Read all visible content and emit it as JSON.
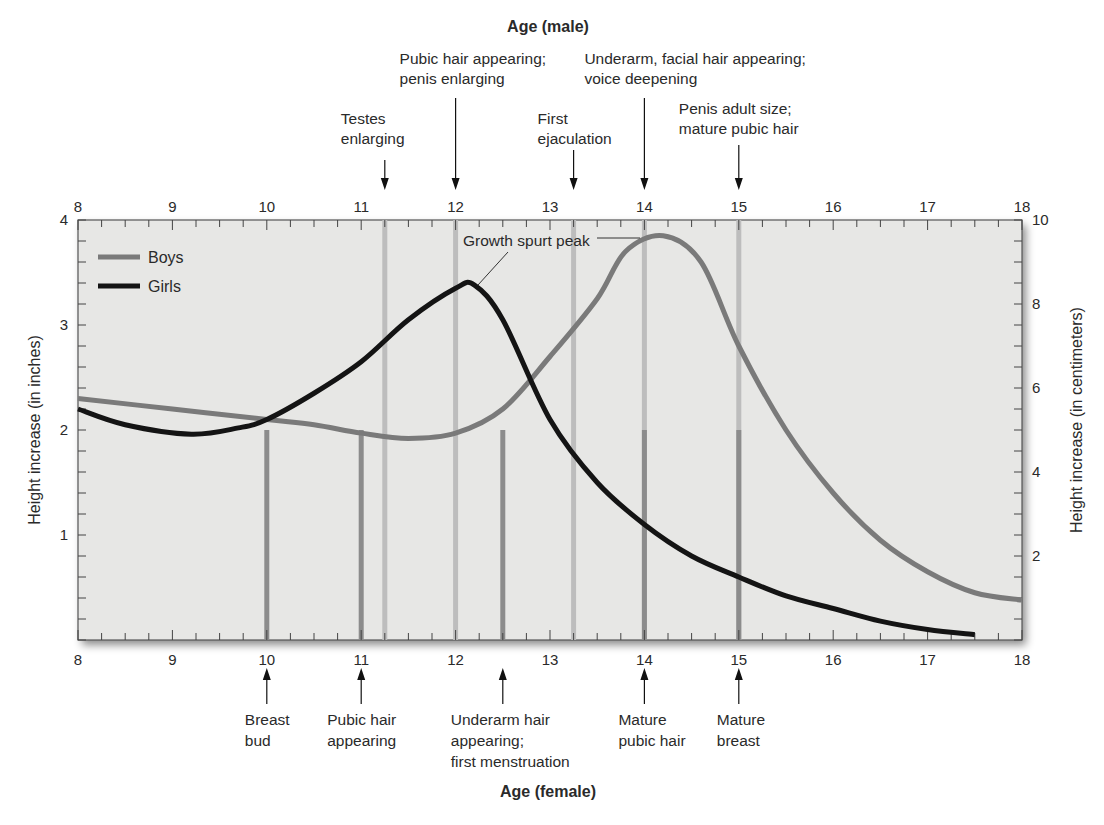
{
  "chart_data": {
    "type": "line",
    "title": "",
    "top_axis_title": "Age (male)",
    "bottom_axis_title": "Age (female)",
    "ylabel_left": "Height increase (in inches)",
    "ylabel_right": "Height increase (in centimeters)",
    "x_ticks": [
      "8",
      "9",
      "10",
      "11",
      "12",
      "13",
      "14",
      "15",
      "16",
      "17",
      "18"
    ],
    "y_ticks_left": [
      "1",
      "2",
      "3",
      "4"
    ],
    "y_ticks_right": [
      "2",
      "4",
      "6",
      "8",
      "10"
    ],
    "ylim_inches": [
      0,
      4
    ],
    "ylim_cm": [
      0,
      10
    ],
    "xlim": [
      8,
      18
    ],
    "grid": false,
    "legend_position": "top-left",
    "legend": [
      {
        "name": "Boys",
        "color": "#7a7a7a"
      },
      {
        "name": "Girls",
        "color": "#141414"
      }
    ],
    "series": [
      {
        "name": "Boys",
        "color": "#7a7a7a",
        "x": [
          8,
          9,
          10,
          10.5,
          11,
          11.5,
          12,
          12.5,
          13,
          13.5,
          13.8,
          14.2,
          14.6,
          15,
          15.5,
          16,
          16.5,
          17,
          17.5,
          18
        ],
        "values": [
          2.3,
          2.2,
          2.1,
          2.05,
          1.97,
          1.92,
          1.97,
          2.2,
          2.7,
          3.25,
          3.7,
          3.85,
          3.6,
          2.8,
          2.0,
          1.4,
          0.95,
          0.65,
          0.45,
          0.38
        ]
      },
      {
        "name": "Girls",
        "color": "#141414",
        "x": [
          8,
          8.5,
          9.2,
          9.7,
          10,
          10.5,
          11,
          11.5,
          12,
          12.2,
          12.5,
          13,
          13.5,
          14,
          14.5,
          15,
          15.5,
          16,
          16.5,
          17,
          17.5
        ],
        "values": [
          2.2,
          2.05,
          1.96,
          2.02,
          2.1,
          2.35,
          2.65,
          3.05,
          3.35,
          3.38,
          3.05,
          2.1,
          1.5,
          1.1,
          0.8,
          0.6,
          0.42,
          0.3,
          0.18,
          0.1,
          0.05
        ]
      }
    ],
    "annotations": {
      "peak_label": "Growth spurt peak",
      "male_milestones": [
        {
          "age": 11.25,
          "lines": [
            "Testes",
            "enlarging"
          ]
        },
        {
          "age": 12.0,
          "lines": [
            "Pubic hair appearing;",
            "penis enlarging"
          ]
        },
        {
          "age": 13.25,
          "lines": [
            "First",
            "ejaculation"
          ]
        },
        {
          "age": 14.0,
          "lines": [
            "Underarm, facial hair appearing;",
            "voice deepening"
          ]
        },
        {
          "age": 15.0,
          "lines": [
            "Penis adult size;",
            "mature pubic hair"
          ]
        }
      ],
      "female_milestones": [
        {
          "age": 10.0,
          "lines": [
            "Breast",
            "bud"
          ]
        },
        {
          "age": 11.0,
          "lines": [
            "Pubic hair",
            "appearing"
          ]
        },
        {
          "age": 12.5,
          "lines": [
            "Underarm hair",
            "appearing;",
            "first menstruation"
          ]
        },
        {
          "age": 14.0,
          "lines": [
            "Mature",
            "pubic hair"
          ]
        },
        {
          "age": 15.0,
          "lines": [
            "Mature",
            "breast"
          ]
        }
      ]
    }
  }
}
